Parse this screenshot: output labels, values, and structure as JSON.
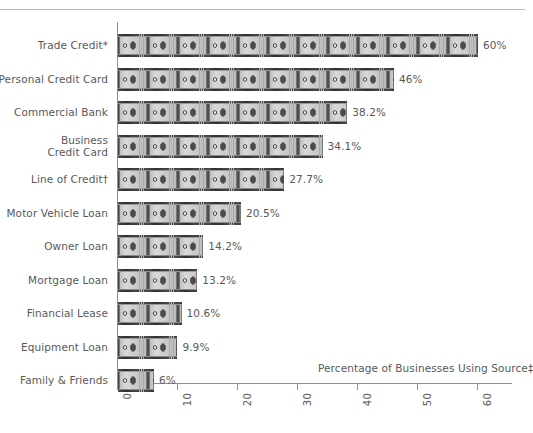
{
  "chart_data": {
    "type": "bar",
    "orientation": "horizontal",
    "title": "",
    "xlabel": "Percentage of Businesses Using Source‡",
    "ylabel": "",
    "xlim": [
      0,
      60
    ],
    "xticks": [
      0,
      10,
      20,
      30,
      40,
      50,
      60
    ],
    "xtick_labels": [
      "0",
      "10",
      "20",
      "30",
      "40",
      "50",
      "60"
    ],
    "grid": false,
    "legend": null,
    "pictograph": "dollar-bill",
    "categories": [
      "Trade Credit*",
      "Personal Credit Card",
      "Commercial Bank",
      "Business\nCredit Card",
      "Line of Credit†",
      "Motor Vehicle Loan",
      "Owner Loan",
      "Mortgage Loan",
      "Financial Lease",
      "Equipment Loan",
      "Family & Friends"
    ],
    "values": [
      60,
      46,
      38.2,
      34.1,
      27.7,
      20.5,
      14.2,
      13.2,
      10.6,
      9.9,
      6
    ],
    "value_labels": [
      "60%",
      "46%",
      "38.2%",
      "34.1%",
      "27.7%",
      "20.5%",
      "14.2%",
      "13.2%",
      "10.6%",
      "9.9%",
      "6%"
    ],
    "series": [
      {
        "name": "Percentage of Businesses Using Source",
        "values": [
          60,
          46,
          38.2,
          34.1,
          27.7,
          20.5,
          14.2,
          13.2,
          10.6,
          9.9,
          6
        ]
      }
    ]
  },
  "colors": {
    "text": "#58595b",
    "axis": "#8d8f91",
    "rule": "#b9bbbd",
    "bar_dark": "#3a3a3a",
    "bar_light": "#d8d9d7",
    "background": "#ffffff"
  }
}
